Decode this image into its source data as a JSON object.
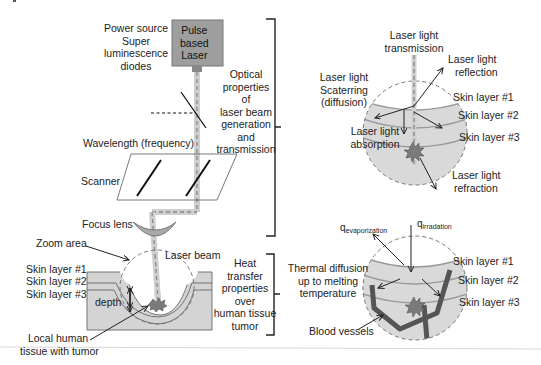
{
  "left_diagram": {
    "laser_source": {
      "box_label": [
        "Pulse",
        "based",
        "Laser"
      ],
      "power_label": [
        "Power source",
        "Super",
        "luminescence",
        "diodes"
      ]
    },
    "wavelength_label": "Wavelength (frequency)",
    "scanner_label": "Scanner",
    "focus_lens_label": "Focus lens",
    "zoom_area_label": "Zoom area",
    "laser_beam_label": "Laser beam",
    "skin_layers": [
      "Skin layer #1",
      "Skin layer #2",
      "Skin layer #3"
    ],
    "depth_label": "depth",
    "tumor_label": [
      "Local human",
      "tissue with tumor"
    ]
  },
  "brackets": {
    "optical": [
      "Optical",
      "properties",
      "of",
      "laser beam",
      "generation",
      "and",
      "transmission"
    ],
    "heat": [
      "Heat",
      "transfer",
      "properties",
      "over",
      "human tissue",
      "tumor"
    ]
  },
  "top_right_zoom": {
    "transmission": [
      "Laser light",
      "transmission"
    ],
    "reflection": [
      "Laser light",
      "reflection"
    ],
    "scattering": [
      "Laser light",
      "Scaterring",
      "(diffusion)"
    ],
    "absorption": [
      "Laser light",
      "absorption"
    ],
    "refraction": [
      "Laser light",
      "refraction"
    ],
    "skin_layers": [
      "Skin layer #1",
      "Skin layer #2",
      "Skin layer #3"
    ]
  },
  "bottom_right_zoom": {
    "q_evaporization": {
      "base": "q",
      "sub": "evaporization"
    },
    "q_irradiation": {
      "base": "q",
      "sub": "irradation"
    },
    "thermal": [
      "Thermal diffusion",
      "up to melting",
      "temperature"
    ],
    "blood_vessels": "Blood vessels",
    "skin_layers": [
      "Skin layer #1",
      "Skin layer #2",
      "Skin layer #3"
    ]
  },
  "colors": {
    "laser_box": "#9e9e9e",
    "tissue": "#d4d4d4",
    "beam": "#bdbdbd",
    "tumor": "#7a7a7a",
    "vessel": "#555555",
    "lens": "#a8a8a8"
  }
}
